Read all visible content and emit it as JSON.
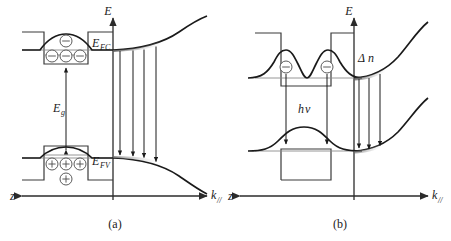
{
  "figure": {
    "title": "",
    "panels": [
      {
        "id": "a",
        "caption": "(a)",
        "axis": {
          "vertical_label": "E",
          "left_label": "z",
          "right_label": "k",
          "right_label_sub": "//"
        },
        "labels": {
          "quasi_fermi_conduction": "E",
          "quasi_fermi_conduction_sub": "FC",
          "quasi_fermi_valence": "E",
          "quasi_fermi_valence_sub": "FV",
          "bandgap": "E",
          "bandgap_sub": "g"
        },
        "carriers": {
          "electron_symbol": "−",
          "hole_symbol": "+",
          "electrons_in_well": 3,
          "electrons_above_well": 1,
          "holes_in_well": 3,
          "holes_below_well": 1
        },
        "transitions": {
          "count": 4,
          "direction": "downward"
        },
        "band_shape": {
          "conduction": "upward-parabolic",
          "valence": "downward-parabolic"
        }
      },
      {
        "id": "b",
        "caption": "(b)",
        "axis": {
          "vertical_label": "E",
          "left_label": "z",
          "right_label": "k",
          "right_label_sub": "//"
        },
        "labels": {
          "photon_energy": "h",
          "photon_energy_sub": "v",
          "carrier_density": "Δ",
          "carrier_density_sub": "n"
        },
        "carriers": {
          "electron_symbol": "−",
          "electrons_in_well": 2
        },
        "transitions": {
          "count": 3,
          "direction": "downward",
          "well_arrows": 2
        },
        "band_shape": {
          "conduction": "upward-parabolic",
          "valence": "upward-parabolic"
        },
        "wavefunctions": {
          "conduction": "double-hump",
          "valence": "single-hump"
        }
      }
    ]
  },
  "colors": {
    "ink": "#1a1a1a",
    "axis": "#2b2b2b",
    "thin": "#8a8a8a",
    "fill_shade": "#6f6f6f",
    "background": "#ffffff"
  }
}
